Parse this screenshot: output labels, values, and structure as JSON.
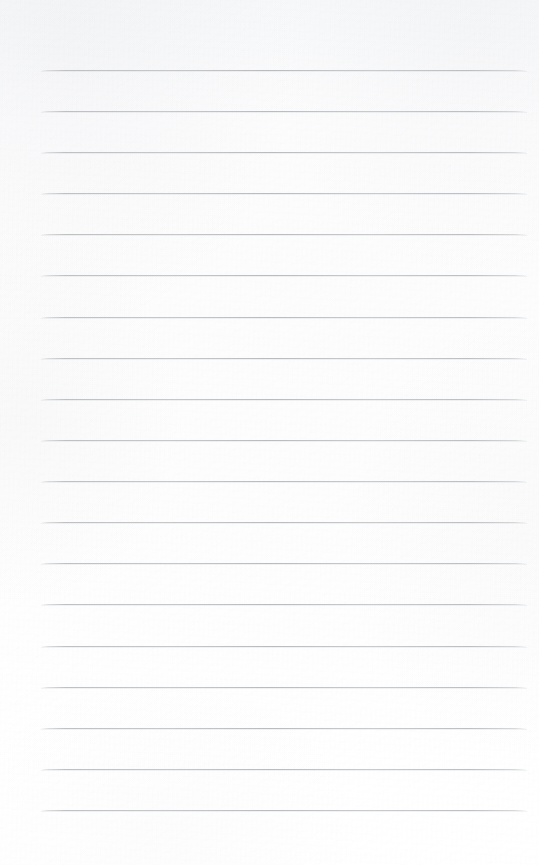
{
  "page": {
    "kind": "blank-lined-notepad-page",
    "width": 539,
    "height": 865,
    "background_color": "#fbfbfc",
    "has_text_content": false,
    "has_handwriting": false,
    "has_margin_rule": false,
    "has_holes": false,
    "note": ""
  },
  "ruling": {
    "line_color": "#bcbfc4",
    "line_thickness_px": 1,
    "line_count": 19,
    "line_left_px": 41,
    "line_right_px": 527,
    "line_width_px": 486,
    "first_line_y_px": 70,
    "last_line_y_px": 810,
    "line_spacing_px": 41.1,
    "lines": [
      {
        "index": 1,
        "y": 70
      },
      {
        "index": 2,
        "y": 111
      },
      {
        "index": 3,
        "y": 152
      },
      {
        "index": 4,
        "y": 193
      },
      {
        "index": 5,
        "y": 234
      },
      {
        "index": 6,
        "y": 275
      },
      {
        "index": 7,
        "y": 317
      },
      {
        "index": 8,
        "y": 358
      },
      {
        "index": 9,
        "y": 399
      },
      {
        "index": 10,
        "y": 440
      },
      {
        "index": 11,
        "y": 481
      },
      {
        "index": 12,
        "y": 522
      },
      {
        "index": 13,
        "y": 563
      },
      {
        "index": 14,
        "y": 604
      },
      {
        "index": 15,
        "y": 646
      },
      {
        "index": 16,
        "y": 687
      },
      {
        "index": 17,
        "y": 728
      },
      {
        "index": 18,
        "y": 769
      },
      {
        "index": 19,
        "y": 810
      }
    ]
  }
}
